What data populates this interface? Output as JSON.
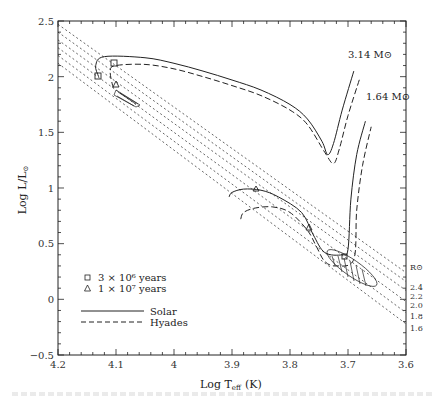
{
  "chart_data": {
    "type": "line",
    "title": "",
    "xlabel": "Log T_eff (K)",
    "ylabel": "Log L/L_sun",
    "xlim": [
      4.2,
      3.6
    ],
    "ylim": [
      -0.5,
      2.5
    ],
    "x_inverted": true,
    "grid": false,
    "x_ticks": [
      "4.2",
      "4.1",
      "4",
      "3.9",
      "3.8",
      "3.7",
      "3.6"
    ],
    "y_ticks": [
      "2.5",
      "2",
      "1.5",
      "1",
      "0.5",
      "0",
      "−0.5"
    ],
    "mass_labels": [
      "3.14 M⊙",
      "1.64 M⊙"
    ],
    "radius_lines": {
      "label": "R⊙",
      "values": [
        "2.4",
        "2.2",
        "2.0",
        "1.8",
        "1.6"
      ]
    },
    "legend": {
      "position": "lower-left",
      "markers": [
        {
          "symbol": "square",
          "label": "3 × 10⁶ years"
        },
        {
          "symbol": "triangle",
          "label": "1 × 10⁷ years"
        }
      ],
      "lines": [
        {
          "style": "solid",
          "label": "Solar"
        },
        {
          "style": "dashed",
          "label": "Hyades"
        }
      ]
    },
    "series": [
      {
        "name": "3.14 Msun Solar",
        "style": "solid",
        "x": [
          4.13,
          4.135,
          4.12,
          4.05,
          4.0,
          3.95,
          3.9,
          3.85,
          3.8,
          3.77,
          3.745,
          3.735,
          3.725,
          3.71,
          3.69
        ],
        "y": [
          2.0,
          2.1,
          2.18,
          2.17,
          2.12,
          2.05,
          1.97,
          1.88,
          1.75,
          1.62,
          1.42,
          1.3,
          1.4,
          1.7,
          2.05
        ]
      },
      {
        "name": "3.14 Msun Hyades",
        "style": "dashed",
        "x": [
          4.105,
          4.11,
          4.1,
          4.05,
          4.0,
          3.95,
          3.9,
          3.85,
          3.8,
          3.77,
          3.74,
          3.725,
          3.715,
          3.7,
          3.68
        ],
        "y": [
          1.9,
          2.05,
          2.1,
          2.11,
          2.07,
          2.0,
          1.92,
          1.83,
          1.7,
          1.57,
          1.32,
          1.22,
          1.35,
          1.65,
          1.98
        ]
      },
      {
        "name": "1.64 Msun Solar",
        "style": "solid",
        "x": [
          3.905,
          3.9,
          3.88,
          3.85,
          3.82,
          3.78,
          3.76,
          3.74,
          3.71,
          3.7,
          3.695,
          3.685,
          3.67
        ],
        "y": [
          0.92,
          0.96,
          0.99,
          0.98,
          0.92,
          0.78,
          0.58,
          0.42,
          0.4,
          0.45,
          0.9,
          1.3,
          1.6
        ]
      },
      {
        "name": "1.64 Msun Hyades",
        "style": "dashed",
        "x": [
          3.885,
          3.88,
          3.86,
          3.83,
          3.8,
          3.77,
          3.755,
          3.74,
          3.72,
          3.69,
          3.685,
          3.675,
          3.66
        ],
        "y": [
          0.72,
          0.78,
          0.82,
          0.83,
          0.78,
          0.62,
          0.48,
          0.34,
          0.3,
          0.36,
          0.8,
          1.2,
          1.55
        ]
      }
    ],
    "radius_line_endpoints": [
      {
        "R": "2.4",
        "from": [
          4.2,
          2.47
        ],
        "to": [
          3.6,
          0.24
        ]
      },
      {
        "R": "2.2",
        "from": [
          4.2,
          2.4
        ],
        "to": [
          3.6,
          0.16
        ]
      },
      {
        "R": "2.0",
        "from": [
          4.2,
          2.33
        ],
        "to": [
          3.6,
          0.08
        ]
      },
      {
        "R": "1.8",
        "from": [
          4.2,
          2.26
        ],
        "to": [
          3.6,
          -0.02
        ]
      },
      {
        "R": "1.6",
        "from": [
          4.2,
          2.19
        ],
        "to": [
          3.6,
          -0.12
        ]
      },
      {
        "R": "1.4",
        "from": [
          4.2,
          2.12
        ],
        "to": [
          3.6,
          -0.22
        ]
      }
    ]
  },
  "figure": {
    "xlabel_main": "Log T",
    "xlabel_sub": "eff",
    "xlabel_unit": "(K)",
    "ylabel_text": "Log L/L",
    "ylabel_sub": "⊙"
  }
}
